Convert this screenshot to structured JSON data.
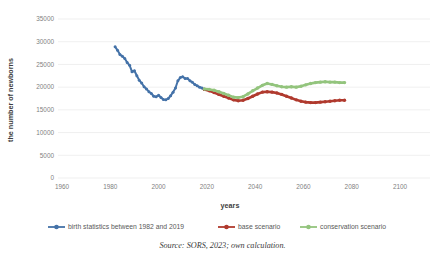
{
  "caption": "Source: SORS, 2023; own calculation.",
  "colors": {
    "blue": "#4472a8",
    "red": "#b03a2e",
    "green": "#93c47d",
    "grid": "#e8e8e8",
    "tick_text": "#7f7f7f",
    "axis_title": "#404040"
  },
  "chart_data": {
    "type": "line",
    "title": "",
    "xlabel": "years",
    "ylabel": "the number of newborns",
    "xlim": [
      1960,
      2100
    ],
    "ylim": [
      0,
      35000
    ],
    "xticks": [
      1960,
      1980,
      2000,
      2020,
      2040,
      2060,
      2080,
      2100
    ],
    "yticks": [
      0,
      5000,
      10000,
      15000,
      20000,
      25000,
      30000,
      35000
    ],
    "grid": true,
    "legend_position": "bottom",
    "markers": true,
    "series": [
      {
        "name": "birth statistics between 1982 and 2019",
        "color": "#4472a8",
        "x": [
          1982,
          1983,
          1984,
          1985,
          1986,
          1987,
          1988,
          1989,
          1990,
          1991,
          1992,
          1993,
          1994,
          1995,
          1996,
          1997,
          1998,
          1999,
          2000,
          2001,
          2002,
          2003,
          2004,
          2005,
          2006,
          2007,
          2008,
          2009,
          2010,
          2011,
          2012,
          2013,
          2014,
          2015,
          2016,
          2017,
          2018,
          2019
        ],
        "values": [
          28900,
          28100,
          27200,
          26800,
          26300,
          25400,
          24800,
          23400,
          23600,
          22500,
          21500,
          20900,
          20100,
          19600,
          19000,
          18600,
          18000,
          17900,
          18200,
          17700,
          17300,
          17200,
          17500,
          18100,
          18900,
          19800,
          21400,
          22100,
          22300,
          21900,
          21900,
          21400,
          21100,
          20600,
          20300,
          20000,
          19800,
          19500
        ]
      },
      {
        "name": "base scenario",
        "color": "#b03a2e",
        "x": [
          2019,
          2021,
          2023,
          2025,
          2027,
          2029,
          2031,
          2033,
          2035,
          2037,
          2039,
          2041,
          2043,
          2045,
          2047,
          2049,
          2051,
          2053,
          2055,
          2057,
          2059,
          2061,
          2063,
          2065,
          2067,
          2069,
          2071,
          2073,
          2075,
          2077
        ],
        "values": [
          19500,
          19200,
          18800,
          18400,
          18000,
          17600,
          17200,
          17000,
          17100,
          17500,
          18000,
          18500,
          18900,
          19000,
          18900,
          18700,
          18400,
          18000,
          17600,
          17200,
          16900,
          16700,
          16600,
          16600,
          16700,
          16800,
          16900,
          17000,
          17100,
          17100
        ]
      },
      {
        "name": "conservation scenario",
        "color": "#93c47d",
        "x": [
          2019,
          2021,
          2023,
          2025,
          2027,
          2029,
          2031,
          2033,
          2035,
          2037,
          2039,
          2041,
          2043,
          2045,
          2047,
          2049,
          2051,
          2053,
          2055,
          2057,
          2059,
          2061,
          2063,
          2065,
          2067,
          2069,
          2071,
          2073,
          2075,
          2077
        ],
        "values": [
          19600,
          19500,
          19300,
          19000,
          18600,
          18200,
          17800,
          17700,
          17900,
          18500,
          19200,
          19800,
          20400,
          20800,
          20600,
          20300,
          20100,
          20000,
          20100,
          20000,
          20200,
          20500,
          20800,
          21000,
          21100,
          21200,
          21100,
          21100,
          21000,
          21000
        ]
      }
    ]
  }
}
